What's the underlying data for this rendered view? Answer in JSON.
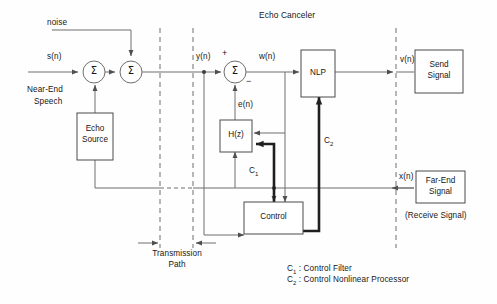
{
  "diagram": {
    "title": "Echo Canceler",
    "type": "block-diagram",
    "background": "#fefefe",
    "line_color": "#6e6e6e",
    "thick_line_color": "#1f1f1f",
    "text_color": "#161616"
  },
  "labels": {
    "noise": "noise",
    "s_n": "s(n)",
    "near_end_speech_line1": "Near-End",
    "near_end_speech_line2": "Speech",
    "y_n": "y(n)",
    "w_n": "w(n)",
    "v_n": "v(n)",
    "e_n": "e(n)",
    "x_n": "x(n)",
    "plus": "+",
    "minus": "−",
    "sigma": "Σ",
    "c1": "C",
    "c1_sub": "1",
    "c2": "C",
    "c2_sub": "2",
    "transmission_line1": "Transmission",
    "transmission_line2": "Path",
    "receive_signal": "(Receive Signal)"
  },
  "blocks": {
    "echo_source": {
      "line1": "Echo",
      "line2": "Source"
    },
    "hz": {
      "label": "H(z)"
    },
    "nlp": {
      "label": "NLP"
    },
    "control": {
      "label": "Control"
    },
    "send_signal": {
      "line1": "Send",
      "line2": "Signal"
    },
    "far_end_signal": {
      "line1": "Far-End",
      "line2": "Signal"
    }
  },
  "legend": {
    "line1_key": "C",
    "line1_sub": "1",
    "line1_text": " : Control Filter",
    "line2_key": "C",
    "line2_sub": "2",
    "line2_text": " : Control Nonlinear Processor"
  }
}
